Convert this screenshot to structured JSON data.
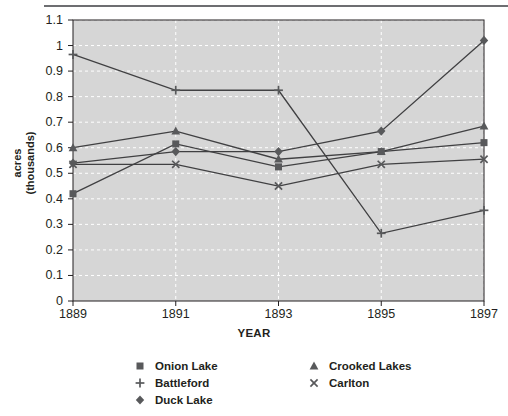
{
  "figure": {
    "top_rule": true,
    "caption_partial": ""
  },
  "chart_data": {
    "type": "line",
    "title": "",
    "xlabel": "YEAR",
    "ylabel": "acres (thousands)",
    "ylabel_lines": [
      "acres",
      "(thousands)"
    ],
    "categories": [
      "1889",
      "1891",
      "1893",
      "1895",
      "1897"
    ],
    "x": [
      1889,
      1891,
      1893,
      1895,
      1897
    ],
    "ylim": [
      0,
      1.1
    ],
    "yticks": [
      "0",
      "0.1",
      "0.2",
      "0.3",
      "0.4",
      "0.5",
      "0.6",
      "0.7",
      "0.8",
      "0.9",
      "1",
      "1.1"
    ],
    "ytick_values": [
      0,
      0.1,
      0.2,
      0.3,
      0.4,
      0.5,
      0.6,
      0.7,
      0.8,
      0.9,
      1.0,
      1.1
    ],
    "grid": "horizontal-and-vertical-white-dashed",
    "plot_background": "#d6d6d6",
    "legend_position": "below-axis",
    "series": [
      {
        "name": "Onion Lake",
        "marker": "square",
        "color": "#58595b",
        "values": [
          0.42,
          0.615,
          0.525,
          0.585,
          0.62
        ]
      },
      {
        "name": "Battleford",
        "marker": "plus",
        "color": "#58595b",
        "values": [
          0.965,
          0.825,
          0.825,
          0.265,
          0.355
        ]
      },
      {
        "name": "Duck Lake",
        "marker": "diamond",
        "color": "#58595b",
        "values": [
          0.54,
          0.585,
          0.585,
          0.665,
          1.02
        ]
      },
      {
        "name": "Crooked Lakes",
        "marker": "triangle",
        "color": "#58595b",
        "values": [
          0.6,
          0.665,
          0.555,
          0.585,
          0.685
        ]
      },
      {
        "name": "Carlton",
        "marker": "cross",
        "color": "#58595b",
        "values": [
          0.535,
          0.535,
          0.45,
          0.535,
          0.555
        ]
      }
    ]
  },
  "legend": {
    "columns": [
      {
        "items": [
          {
            "label": "Onion Lake",
            "marker": "square"
          },
          {
            "label": "Battleford",
            "marker": "plus"
          },
          {
            "label": "Duck Lake",
            "marker": "diamond"
          }
        ]
      },
      {
        "items": [
          {
            "label": "Crooked Lakes",
            "marker": "triangle"
          },
          {
            "label": "Carlton",
            "marker": "cross"
          }
        ]
      }
    ]
  },
  "colors": {
    "marker": "#58595b",
    "line": "#404042",
    "plot_bg": "#d6d6d6",
    "axis": "#231f20",
    "rule": "#6d6e71",
    "grid": "#ffffff"
  }
}
